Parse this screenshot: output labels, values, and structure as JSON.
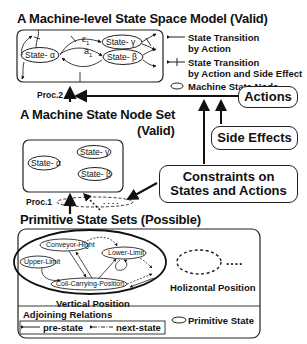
{
  "model": {
    "title": "A Machine-level State Space Model (Valid)",
    "states": {
      "alpha": "State- α",
      "beta": "State- β",
      "gamma": "State- γ"
    },
    "edge_labels": {
      "epsilon": "ε",
      "epsilon_sub": "1",
      "a": "a",
      "a_sub": "1"
    }
  },
  "legend": {
    "transition_action_1": "State Transition",
    "transition_action_2": "by Action",
    "transition_side_1": "State Transition",
    "transition_side_2": "by Action and Side Effect",
    "node": "Machine State Node"
  },
  "proc2": "Proc.2",
  "proc1": "Proc.1",
  "node_set": {
    "title": "A Machine State Node Set",
    "subtitle": "(Valid)",
    "states": {
      "alpha": "State- α",
      "beta": "State- β",
      "gamma": "State- γ"
    }
  },
  "actions": "Actions",
  "side_effects": "Side Effects",
  "constraints": {
    "line1": "Constraints on",
    "line2": "States and Actions"
  },
  "primitive": {
    "title": "Primitive State Sets (Possible)",
    "states": {
      "conveyor": "Conveyor-Hight",
      "lower": "Lower-Limit",
      "upper": "Upper-Limit",
      "coil": "Coil-Carrying-Position"
    },
    "vertical": "Vertical Position",
    "horizontal": "Holizontal Position",
    "ellipsis": "....",
    "adjoining_title": "Adjoining Relations",
    "pre_state": "pre-state",
    "next_state": "next-state",
    "primitive_state": "Primitive State"
  }
}
